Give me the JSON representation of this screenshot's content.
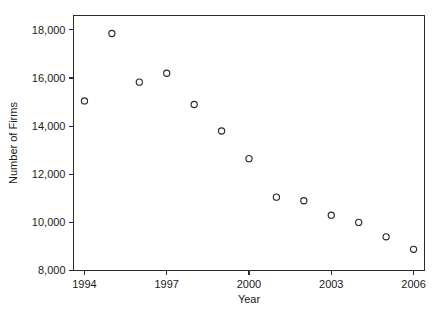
{
  "chart_data": {
    "type": "scatter",
    "title": "",
    "xlabel": "Year",
    "ylabel": "Number of Firms",
    "xlim": [
      1993.6,
      2006.4
    ],
    "ylim": [
      8000,
      18600
    ],
    "grid": false,
    "legend": null,
    "marker_style": "open-circle",
    "x_ticks": [
      1994,
      1997,
      2000,
      2003,
      2006
    ],
    "x_tick_labels": [
      "1994",
      "1997",
      "2000",
      "2003",
      "2006"
    ],
    "y_ticks": [
      8000,
      10000,
      12000,
      14000,
      16000,
      18000
    ],
    "y_tick_labels": [
      "8,000",
      "10,000",
      "12,000",
      "14,000",
      "16,000",
      "18,000"
    ],
    "x": [
      1994,
      1995,
      1996,
      1997,
      1998,
      1999,
      2000,
      2001,
      2002,
      2003,
      2004,
      2005,
      2006
    ],
    "values": [
      15050,
      17850,
      15830,
      16200,
      14900,
      13800,
      12650,
      11050,
      10900,
      10300,
      10000,
      9400,
      8880
    ],
    "points": [
      {
        "x": 1994,
        "y": 15050
      },
      {
        "x": 1995,
        "y": 17850
      },
      {
        "x": 1996,
        "y": 15830
      },
      {
        "x": 1997,
        "y": 16200
      },
      {
        "x": 1998,
        "y": 14900
      },
      {
        "x": 1999,
        "y": 13800
      },
      {
        "x": 2000,
        "y": 12650
      },
      {
        "x": 2001,
        "y": 11050
      },
      {
        "x": 2002,
        "y": 10900
      },
      {
        "x": 2003,
        "y": 10300
      },
      {
        "x": 2004,
        "y": 10000
      },
      {
        "x": 2005,
        "y": 9400
      },
      {
        "x": 2006,
        "y": 8880
      }
    ],
    "colors": {
      "marker_stroke": "#2b2b2b",
      "axis": "#2b2b2b",
      "background": "#ffffff",
      "text": "#1a1a1a"
    }
  }
}
